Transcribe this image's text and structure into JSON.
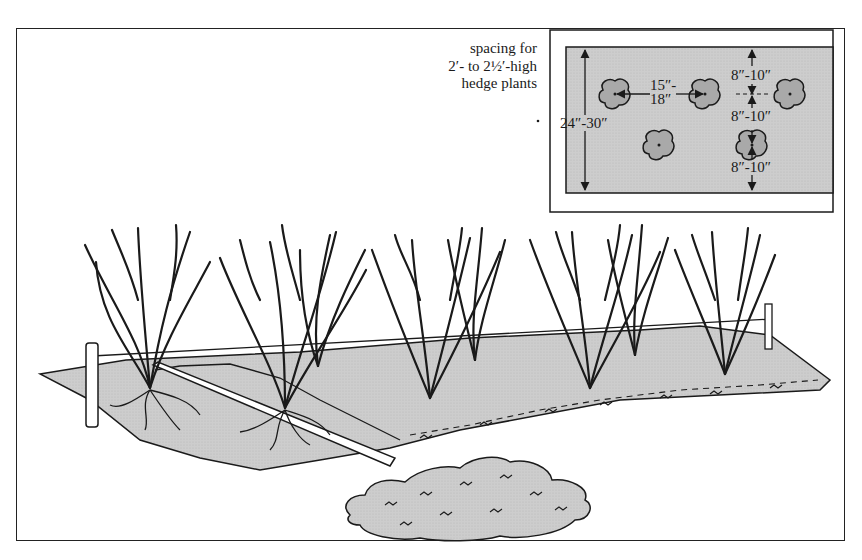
{
  "figure": {
    "caption_lines": [
      "spacing for",
      "2′- to 2½′-high",
      "hedge plants"
    ],
    "inset": {
      "height_label": "24″-30″",
      "row_spacing_label_1": "15″-",
      "row_spacing_label_2": "18″",
      "offset_labels": [
        "8″-10″",
        "8″-10″",
        "8″-10″"
      ]
    },
    "colors": {
      "ink": "#1a1a1a",
      "mulch_fill": "#c9c9c9",
      "plant_fill": "#a9a9a9",
      "background": "#ffffff"
    },
    "elements": [
      "string line between stakes",
      "planting trench",
      "board",
      "mulch pile",
      "7 bare-root hedge plants"
    ]
  }
}
